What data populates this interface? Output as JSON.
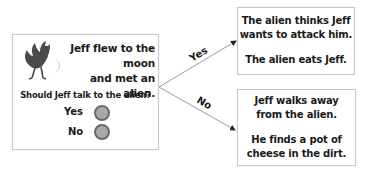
{
  "start": {
    "story_line1": "Jeff flew to the moon",
    "story_line2": "and met an alien.",
    "question": "Should Jeff talk to the alien?",
    "options": [
      {
        "label": "Yes",
        "color": "#a9a9a9"
      },
      {
        "label": "No",
        "color": "#a9a9a9"
      }
    ]
  },
  "branches": {
    "yes_label": "Yes",
    "no_label": "No"
  },
  "outcomes": {
    "yes": {
      "line1": "The alien thinks Jeff",
      "line2": "wants to attack him.",
      "line3": "The alien eats Jeff."
    },
    "no": {
      "line1": "Jeff walks away",
      "line2": "from the alien.",
      "line3": "He finds a pot of",
      "line4": "cheese in the dirt."
    }
  },
  "colors": {
    "border": "#c8c8c8",
    "radio_fill": "#a9a9a9",
    "radio_ring": "#6a6a6a",
    "bird": "#4a4a4a",
    "moon": "#d8d2b0"
  }
}
